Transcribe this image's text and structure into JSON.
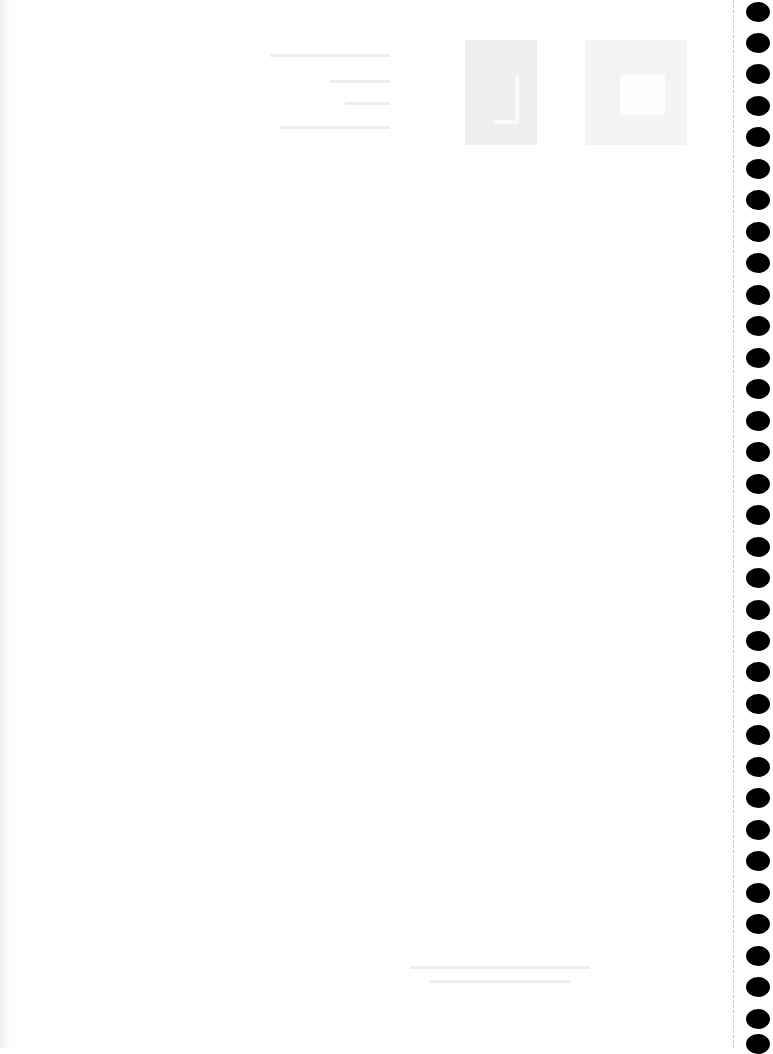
{
  "document": {
    "type": "blank notebook page (scan)",
    "text_content": ""
  },
  "binding": {
    "hole_count": 34,
    "hole_positions_y": [
      2,
      33,
      64,
      96,
      127,
      159,
      190,
      222,
      253,
      285,
      316,
      348,
      379,
      411,
      442,
      474,
      505,
      537,
      568,
      600,
      631,
      662,
      694,
      725,
      757,
      788,
      820,
      851,
      883,
      914,
      946,
      977,
      1009,
      1034
    ],
    "hole_color": "#000000",
    "perforation_color": "#c8c8c8"
  },
  "colors": {
    "paper": "#ffffff",
    "bleed": "#eeeeee"
  }
}
